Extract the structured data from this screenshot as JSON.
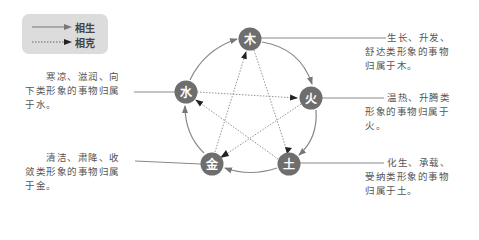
{
  "legend": {
    "items": [
      {
        "label": "相生",
        "style": "solid"
      },
      {
        "label": "相克",
        "style": "dotted"
      }
    ]
  },
  "nodes": {
    "wood": {
      "label": "木"
    },
    "fire": {
      "label": "火"
    },
    "earth": {
      "label": "土"
    },
    "metal": {
      "label": "金"
    },
    "water": {
      "label": "水"
    }
  },
  "descriptions": {
    "wood": [
      "生长、升发、",
      "舒达类形象的事物",
      "归属于木。"
    ],
    "fire": [
      "温热、升腾类",
      "形象的事物归属于",
      "火。"
    ],
    "earth": [
      "化生、承载、",
      "受纳类形象的事物",
      "归属于土。"
    ],
    "metal": [
      "清洁、肃降、收",
      "敛类形象的事物归属",
      "于金。"
    ],
    "water": [
      "寒凉、滋润、向",
      "下类形象的事物归属",
      "于水。"
    ]
  },
  "colors": {
    "node_fill": "#6e6e6e",
    "line": "#888888",
    "legend_bg": "#dcdcdc"
  }
}
